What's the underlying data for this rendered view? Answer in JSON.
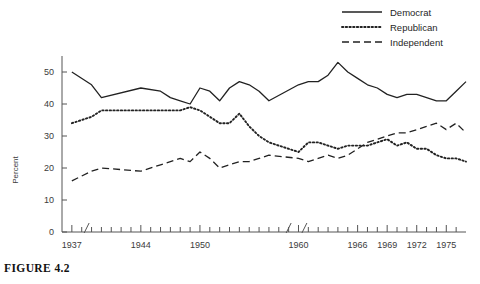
{
  "figure": {
    "caption": "FIGURE 4.2"
  },
  "legend": {
    "position": "top-right",
    "items": [
      {
        "label": "Democrat",
        "style": "solid",
        "color": "#222222"
      },
      {
        "label": "Republican",
        "style": "dotted",
        "color": "#222222"
      },
      {
        "label": "Independent",
        "style": "dashed",
        "color": "#222222"
      }
    ]
  },
  "axes": {
    "ylabel": "Percent",
    "yticks": [
      0,
      10,
      20,
      30,
      40,
      50
    ],
    "ylim": [
      0,
      55
    ],
    "xticklabels": [
      "1937",
      "1944",
      "1950",
      "1960",
      "1966",
      "1969",
      "1972",
      "1975"
    ],
    "xtick_years": [
      1937,
      1944,
      1950,
      1960,
      1966,
      1969,
      1972,
      1975
    ],
    "xlim": [
      1936,
      1977
    ],
    "axis_breaks": [
      1938.5,
      1959.0,
      1960.6
    ],
    "grid": false
  },
  "chart_data": {
    "type": "line",
    "title": "",
    "xlabel": "",
    "ylabel": "Percent",
    "ylim": [
      0,
      55
    ],
    "grid": false,
    "legend_position": "top-right",
    "x": [
      1937,
      1939,
      1940,
      1944,
      1946,
      1947,
      1948,
      1949,
      1950,
      1951,
      1952,
      1953,
      1954,
      1955,
      1956,
      1957,
      1960,
      1961,
      1962,
      1963,
      1964,
      1965,
      1966,
      1967,
      1968,
      1969,
      1970,
      1971,
      1972,
      1973,
      1974,
      1975,
      1976,
      1977
    ],
    "series": [
      {
        "name": "Democrat",
        "style": "solid",
        "values": [
          50,
          46,
          42,
          45,
          44,
          42,
          41,
          40,
          45,
          44,
          41,
          45,
          47,
          46,
          44,
          41,
          46,
          47,
          47,
          49,
          53,
          50,
          48,
          46,
          45,
          43,
          42,
          43,
          43,
          42,
          41,
          41,
          44,
          47
        ]
      },
      {
        "name": "Republican",
        "style": "dotted",
        "values": [
          34,
          36,
          38,
          38,
          38,
          38,
          38,
          39,
          38,
          36,
          34,
          34,
          37,
          33,
          30,
          28,
          25,
          28,
          28,
          27,
          26,
          27,
          27,
          27,
          28,
          29,
          27,
          28,
          26,
          26,
          24,
          23,
          23,
          22
        ]
      },
      {
        "name": "Independent",
        "style": "dashed",
        "values": [
          16,
          19,
          20,
          19,
          21,
          22,
          23,
          22,
          25,
          23,
          20,
          21,
          22,
          22,
          23,
          24,
          23,
          22,
          23,
          24,
          23,
          24,
          26,
          28,
          29,
          30,
          31,
          31,
          32,
          33,
          34,
          32,
          34,
          31
        ]
      }
    ]
  }
}
